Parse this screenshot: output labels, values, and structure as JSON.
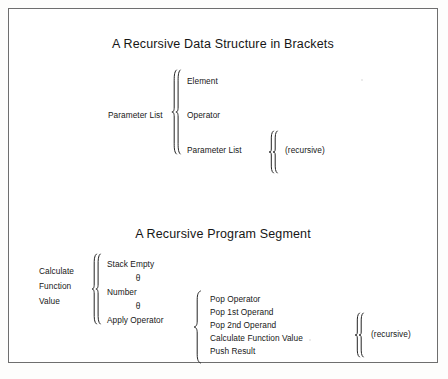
{
  "figure": {
    "top": {
      "title": "A Recursive Data Structure in Brackets",
      "left_label": "Parameter List",
      "items": [
        "Element",
        "Operator",
        "Parameter List"
      ],
      "recursive_note": "(recursive)"
    },
    "bottom": {
      "title": "A Recursive Program Segment",
      "left_label_lines": [
        "Calculate",
        "Function",
        "Value"
      ],
      "alternatives": [
        "Stack Empty",
        "Number",
        "Apply Operator"
      ],
      "alternative_separator": "θ",
      "steps": [
        "Pop Operator",
        "Pop 1st Operand",
        "Pop 2nd Operand",
        "Calculate Function Value",
        "Push Result"
      ],
      "recursive_note": "(recursive)"
    }
  },
  "colors": {
    "ink": "#171717",
    "frame": "#6e6e6e",
    "paper": "#ffffff"
  }
}
